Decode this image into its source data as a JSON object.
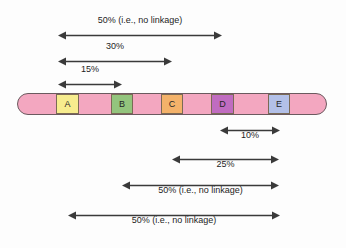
{
  "figure": {
    "chromosome": {
      "name": "chromosome-bar",
      "backbone_color": "#f3a7c0",
      "outline_color": "#6b5a5f",
      "x": 17,
      "y": 93,
      "width": 310,
      "height": 22,
      "genes": [
        {
          "label": "A",
          "color": "#f7ec8e",
          "x": 55,
          "width": 23
        },
        {
          "label": "B",
          "color": "#93c47d",
          "x": 110,
          "width": 22
        },
        {
          "label": "C",
          "color": "#f4b26a",
          "x": 160,
          "width": 22
        },
        {
          "label": "D",
          "color": "#c06cc0",
          "x": 210,
          "width": 23
        },
        {
          "label": "E",
          "color": "#b3c0e8",
          "x": 267,
          "width": 22
        }
      ]
    },
    "measurements_above": [
      {
        "id": "a-to-d",
        "label": "50% (i.e., no linkage)",
        "value": 50,
        "from_gene": "A",
        "to_gene": "D",
        "x": 58,
        "width": 164,
        "y": 31,
        "label_y": 15
      },
      {
        "id": "a-to-c",
        "label": "30%",
        "value": 30,
        "from_gene": "A",
        "to_gene": "C",
        "x": 58,
        "width": 114,
        "y": 57,
        "label_y": 41
      },
      {
        "id": "a-to-b",
        "label": "15%",
        "value": 15,
        "from_gene": "A",
        "to_gene": "B",
        "x": 58,
        "width": 64,
        "y": 80,
        "label_y": 64
      }
    ],
    "measurements_below": [
      {
        "id": "d-to-e",
        "label": "10%",
        "value": 10,
        "from_gene": "D",
        "to_gene": "E",
        "x": 220,
        "width": 60,
        "y": 126,
        "label_y": 130
      },
      {
        "id": "c-to-e",
        "label": "25%",
        "value": 25,
        "from_gene": "C",
        "to_gene": "E",
        "x": 172,
        "width": 107,
        "y": 155,
        "label_y": 159
      },
      {
        "id": "b-to-e",
        "label": "50% (i.e., no linkage)",
        "value": 50,
        "from_gene": "B",
        "to_gene": "E",
        "x": 122,
        "width": 157,
        "y": 181,
        "label_y": 185
      },
      {
        "id": "a-to-e",
        "label": "50% (i.e., no linkage)",
        "value": 50,
        "from_gene": "A",
        "to_gene": "E",
        "x": 68,
        "width": 212,
        "y": 211,
        "label_y": 215
      }
    ],
    "colors": {
      "arrow_stroke": "#3a3a3a",
      "text": "#1d1d1d",
      "background": "#fdfdfd"
    }
  }
}
